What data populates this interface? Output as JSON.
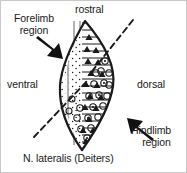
{
  "figure": {
    "caption": "N. lateralis (Deiters)",
    "background_color": "#ffffff",
    "border_color": "#c8c8c8",
    "ink_color": "#1a1a1a"
  },
  "labels": {
    "rostral": "rostral",
    "ventral": "ventral",
    "dorsal": "dorsal",
    "forelimb_line1": "Forelimb",
    "forelimb_line2": "region",
    "hindlimb_line1": "Hindlimb",
    "hindlimb_line2": "region"
  },
  "annotations": {
    "forelimb_arrow": "arrow pointing down-right into ventral-rostral zone",
    "hindlimb_arrow": "arrow pointing up-left into dorsal-caudal zone",
    "dashed_boundary_upper": "dashed line from upper right into nucleus",
    "dashed_boundary_lower": "dashed line from lower left into nucleus"
  },
  "nucleus": {
    "shape": "lens",
    "ventral_fill": "stipple-dots",
    "dorsal_fill": "horizontal-hatch",
    "symbols": [
      "filled-triangle",
      "open-circle",
      "open-circle-with-dot"
    ]
  }
}
